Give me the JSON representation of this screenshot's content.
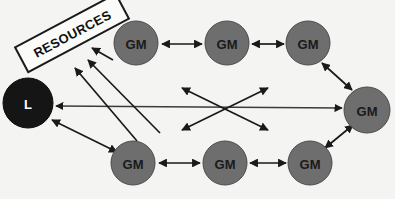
{
  "diagram": {
    "background_color": "#f4f4f2",
    "resources_box": {
      "label": "RESOURCES",
      "rotation_deg": -28,
      "fill": "#fbfbf9",
      "stroke": "#1a1a1a"
    },
    "palette": {
      "gm_fill": "#6e6e6e",
      "gm_stroke": "#4a4a4a",
      "gm_text": "#1a1a1a",
      "l_fill": "#151515",
      "l_stroke": "#0b0b0b",
      "l_text": "#ffffff",
      "arrow": "#1a1a1a"
    },
    "nodes": [
      {
        "id": "L",
        "label": "L",
        "cx": 28,
        "cy": 103,
        "r": 25,
        "type": "leader"
      },
      {
        "id": "GM-TL",
        "label": "GM",
        "cx": 136,
        "cy": 43,
        "r": 22,
        "type": "member"
      },
      {
        "id": "GM-TM",
        "label": "GM",
        "cx": 227,
        "cy": 43,
        "r": 22,
        "type": "member"
      },
      {
        "id": "GM-TR",
        "label": "GM",
        "cx": 308,
        "cy": 43,
        "r": 22,
        "type": "member"
      },
      {
        "id": "GM-R",
        "label": "GM",
        "cx": 367,
        "cy": 110,
        "r": 23,
        "type": "member"
      },
      {
        "id": "GM-BL",
        "label": "GM",
        "cx": 133,
        "cy": 163,
        "r": 22,
        "type": "member"
      },
      {
        "id": "GM-BM",
        "label": "GM",
        "cx": 225,
        "cy": 163,
        "r": 22,
        "type": "member"
      },
      {
        "id": "GM-BR",
        "label": "GM",
        "cx": 310,
        "cy": 163,
        "r": 22,
        "type": "member"
      }
    ],
    "edges": [
      {
        "id": "e-tl-tm",
        "from": "GM-TL",
        "to": "GM-TM",
        "heads": "both"
      },
      {
        "id": "e-tm-tr",
        "from": "GM-TM",
        "to": "GM-TR",
        "heads": "both"
      },
      {
        "id": "e-tr-r",
        "from": "GM-TR",
        "to": "GM-R",
        "heads": "both"
      },
      {
        "id": "e-bl-bm",
        "from": "GM-BL",
        "to": "GM-BM",
        "heads": "both"
      },
      {
        "id": "e-bm-br",
        "from": "GM-BM",
        "to": "GM-BR",
        "heads": "both"
      },
      {
        "id": "e-br-r",
        "from": "GM-BR",
        "to": "GM-R",
        "heads": "both"
      },
      {
        "id": "e-l-r",
        "from": "GM-R",
        "to": "L",
        "heads": "both"
      },
      {
        "id": "e-l-bl",
        "from": "L",
        "to": "GM-BL",
        "heads": "both"
      },
      {
        "id": "e-cross-1",
        "from": "center",
        "to": "upper-left",
        "heads": "both"
      },
      {
        "id": "e-cross-2",
        "from": "center",
        "to": "upper-right",
        "heads": "both"
      },
      {
        "id": "e-res-tl",
        "from": "GM-TL",
        "to": "RESOURCES",
        "heads": "single"
      },
      {
        "id": "e-res-a",
        "from": "lower-right-a",
        "to": "RESOURCES",
        "heads": "single"
      },
      {
        "id": "e-res-b",
        "from": "lower-right-b",
        "to": "RESOURCES",
        "heads": "single"
      }
    ]
  }
}
